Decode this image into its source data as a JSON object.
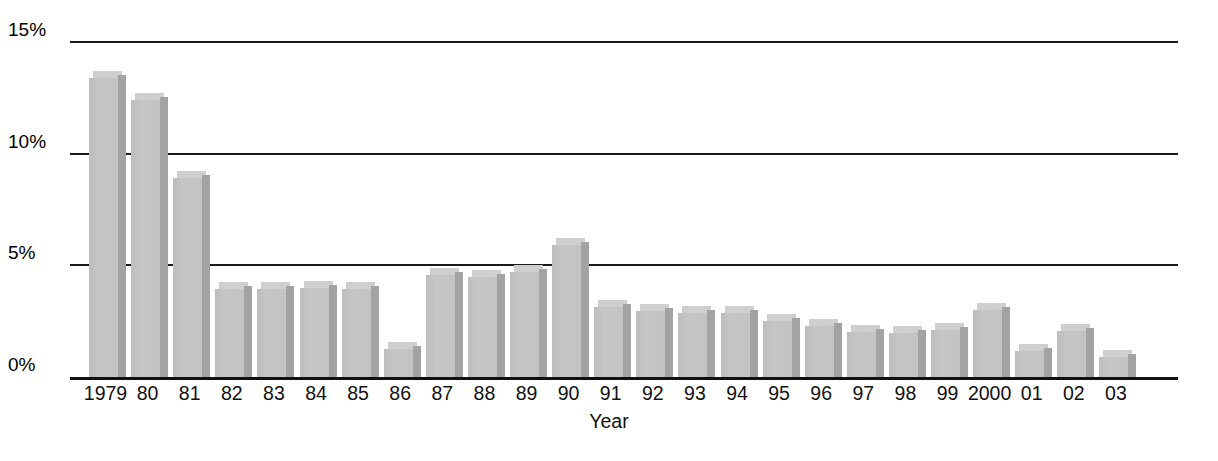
{
  "chart_data": {
    "type": "bar",
    "title": "",
    "xlabel": "Year",
    "ylabel": "",
    "categories": [
      "1979",
      "80",
      "81",
      "82",
      "83",
      "84",
      "85",
      "86",
      "87",
      "88",
      "89",
      "90",
      "91",
      "92",
      "93",
      "94",
      "95",
      "96",
      "97",
      "98",
      "99",
      "2000",
      "01",
      "02",
      "03"
    ],
    "values": [
      13.4,
      12.4,
      8.9,
      3.95,
      3.95,
      4.0,
      3.95,
      1.25,
      4.55,
      4.5,
      4.7,
      5.9,
      3.15,
      2.95,
      2.85,
      2.85,
      2.5,
      2.3,
      2.0,
      1.95,
      2.1,
      3.0,
      1.15,
      2.05,
      0.9
    ],
    "ylim": [
      0,
      15
    ],
    "ytick_values": [
      0,
      5,
      10,
      15
    ],
    "ytick_labels": [
      "0%",
      "5%",
      "10%",
      "15%"
    ],
    "grid": true,
    "legend": null,
    "colors": {
      "bar_face": "#c2c2c2",
      "bar_side": "#a3a3a3",
      "bar_top": "#cfcfcf",
      "gridline": "#1a1a1a",
      "text": "#111111",
      "background": "#ffffff"
    }
  }
}
